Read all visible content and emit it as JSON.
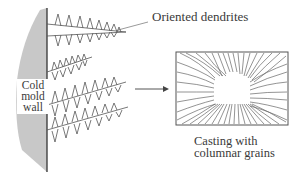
{
  "diagram": {
    "labels": {
      "dendrites": "Oriented dendrites",
      "wall_line1": "Cold",
      "wall_line2": "mold",
      "wall_line3": "wall",
      "casting_line1": "Casting with",
      "casting_line2": "columnar grains"
    },
    "colors": {
      "wall_fill": "#c8c8c8",
      "wall_edge": "#333333",
      "line": "#555555",
      "background": "#ffffff"
    },
    "elements": {
      "wall": "cold-mold-wall",
      "dendrite_count": 4,
      "arrow": "right-arrow",
      "grain_box": "casting-cross-section"
    }
  }
}
